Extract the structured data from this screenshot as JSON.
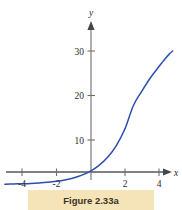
{
  "figure": {
    "caption": "Figure 2.33a",
    "caption_band_color": "#f4e4b8",
    "background_color": "#ffffff"
  },
  "chart_data": {
    "type": "line",
    "title": "",
    "subtitle": "",
    "xlabel": "x",
    "ylabel": "y",
    "curve_color": "#2a4fae",
    "axis_color": "#6e6e70",
    "grid": false,
    "legend": null,
    "xlim": [
      -5.0,
      5.4
    ],
    "ylim": [
      -2.0,
      33.0
    ],
    "xticks": [
      -4,
      -2,
      2,
      4
    ],
    "xtick_labels": [
      "-4",
      "-2",
      "2",
      "4"
    ],
    "yticks": [
      10,
      20,
      30
    ],
    "ytick_labels": [
      "10",
      "20",
      "30"
    ],
    "series": [
      {
        "name": "exponential-curve",
        "x": [
          -5.0,
          -4.5,
          -4.0,
          -3.5,
          -3.0,
          -2.5,
          -2.0,
          -1.5,
          -1.0,
          -0.5,
          0.0,
          0.5,
          1.0,
          1.5,
          2.0,
          2.5,
          3.0,
          3.5,
          4.0,
          4.3,
          4.6,
          4.8
        ],
        "y": [
          0.08,
          0.12,
          0.17,
          0.24,
          0.35,
          0.5,
          0.72,
          1.03,
          1.47,
          2.1,
          3.0,
          4.3,
          6.1,
          8.7,
          12.4,
          17.7,
          21.0,
          24.0,
          26.5,
          28.0,
          29.3,
          30.0
        ]
      }
    ]
  },
  "axes": {
    "y_axis_label": "y",
    "x_axis_label": "x"
  }
}
